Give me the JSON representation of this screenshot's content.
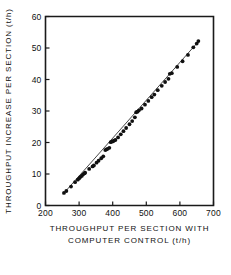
{
  "chart_data": {
    "type": "scatter",
    "title": "",
    "xlabel_line1": "THROUGHPUT PER SECTION WITH",
    "xlabel_line2": "COMPUTER CONTROL (t/h)",
    "ylabel": "THROUGHPUT INCREASE PER SECTION (t/h)",
    "xlim": [
      200,
      700
    ],
    "ylim": [
      0,
      60
    ],
    "xticks": [
      200,
      300,
      400,
      500,
      600,
      700
    ],
    "yticks": [
      0,
      10,
      20,
      30,
      40,
      50,
      60
    ],
    "xtick_labels": [
      "200",
      "300",
      "400",
      "500",
      "600",
      "700"
    ],
    "ytick_labels": [
      "0",
      "10",
      "20",
      "30",
      "40",
      "50",
      "60"
    ],
    "grid": false,
    "legend": "none",
    "marker": "filled-circle",
    "marker_color": "#111111",
    "line_color": "#1a1a1a",
    "has_fit_line": true,
    "fit_line_endpoints": [
      [
        252,
        3.6
      ],
      [
        658,
        52.4
      ]
    ],
    "points": [
      [
        255,
        4.0
      ],
      [
        262,
        4.6
      ],
      [
        276,
        6.0
      ],
      [
        288,
        7.4
      ],
      [
        296,
        8.2
      ],
      [
        300,
        8.6
      ],
      [
        303,
        9.0
      ],
      [
        308,
        9.4
      ],
      [
        312,
        9.9
      ],
      [
        316,
        10.2
      ],
      [
        318,
        10.4
      ],
      [
        330,
        11.6
      ],
      [
        340,
        12.4
      ],
      [
        344,
        12.7
      ],
      [
        352,
        13.6
      ],
      [
        358,
        14.2
      ],
      [
        366,
        15.0
      ],
      [
        372,
        15.6
      ],
      [
        378,
        17.6
      ],
      [
        381,
        17.8
      ],
      [
        385,
        18.0
      ],
      [
        390,
        18.3
      ],
      [
        394,
        20.1
      ],
      [
        398,
        20.3
      ],
      [
        401,
        20.4
      ],
      [
        404,
        20.6
      ],
      [
        408,
        20.8
      ],
      [
        416,
        21.6
      ],
      [
        424,
        22.6
      ],
      [
        432,
        23.6
      ],
      [
        440,
        24.6
      ],
      [
        450,
        25.8
      ],
      [
        458,
        26.8
      ],
      [
        466,
        28.0
      ],
      [
        470,
        29.6
      ],
      [
        474,
        29.8
      ],
      [
        478,
        30.2
      ],
      [
        486,
        30.8
      ],
      [
        496,
        32.0
      ],
      [
        506,
        33.2
      ],
      [
        516,
        34.4
      ],
      [
        524,
        35.2
      ],
      [
        534,
        36.6
      ],
      [
        546,
        38.0
      ],
      [
        556,
        39.2
      ],
      [
        566,
        40.2
      ],
      [
        570,
        41.8
      ],
      [
        576,
        42.0
      ],
      [
        592,
        44.0
      ],
      [
        608,
        45.8
      ],
      [
        624,
        47.8
      ],
      [
        640,
        50.2
      ],
      [
        650,
        51.4
      ],
      [
        655,
        52.2
      ]
    ]
  }
}
